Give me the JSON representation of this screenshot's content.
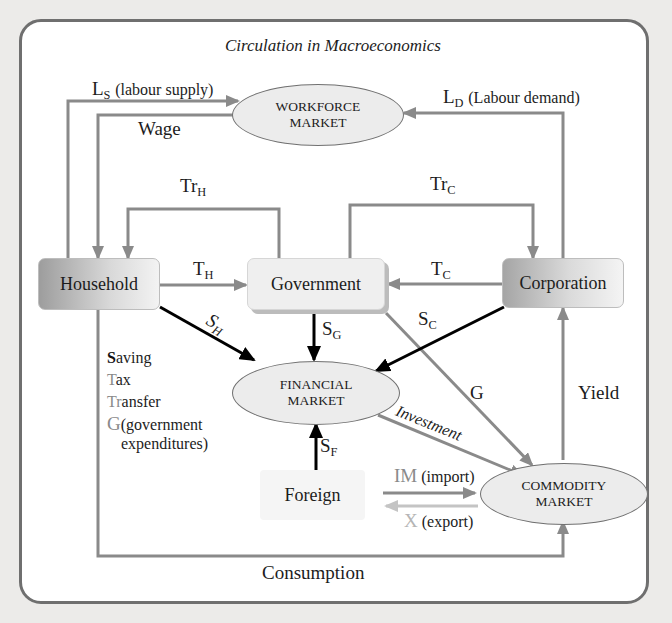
{
  "title": "Circulation in Macroeconomics",
  "nodes": {
    "household": "Household",
    "government": "Government",
    "corporation": "Corporation",
    "foreign": "Foreign",
    "workforce_market": [
      "WORKFORCE",
      "MARKET"
    ],
    "financial_market": [
      "FINANCIAL",
      "MARKET"
    ],
    "commodity_market": [
      "COMMODITY",
      "MARKET"
    ]
  },
  "flows": {
    "labour_supply": {
      "symbol": "L",
      "sub": "S",
      "text": "(labour supply)"
    },
    "labour_demand": {
      "symbol": "L",
      "sub": "D",
      "text": "(Labour demand)"
    },
    "wage": "Wage",
    "transfer_household": {
      "symbol": "Tr",
      "sub": "H"
    },
    "transfer_corporation": {
      "symbol": "Tr",
      "sub": "C"
    },
    "tax_household": {
      "symbol": "T",
      "sub": "H"
    },
    "tax_corporation": {
      "symbol": "T",
      "sub": "C"
    },
    "saving_household": {
      "symbol": "S",
      "sub": "H"
    },
    "saving_government": {
      "symbol": "S",
      "sub": "G"
    },
    "saving_corporation": {
      "symbol": "S",
      "sub": "C"
    },
    "saving_foreign": {
      "symbol": "S",
      "sub": "F"
    },
    "government_expenditure": "G",
    "investment": "Investment",
    "yield": "Yield",
    "import": {
      "symbol": "IM",
      "text": "(import)"
    },
    "export": {
      "symbol": "X",
      "text": "(export)"
    },
    "consumption": "Consumption"
  },
  "legend": [
    {
      "initial": "S",
      "rest": "aving"
    },
    {
      "initial": "T",
      "rest": "ax"
    },
    {
      "initial": "Tr",
      "rest": "ansfer"
    },
    {
      "initial": "G",
      "rest": "(government",
      "rest2": "expenditures)"
    }
  ],
  "colors": {
    "grey_arrow": "#8a8a8a",
    "black_arrow": "#000000",
    "light_arrow": "#c4c4c4",
    "frame": "#6f6f6f"
  }
}
